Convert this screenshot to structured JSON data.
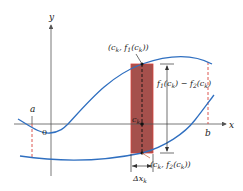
{
  "figure": {
    "type": "area-between-curves",
    "axes": {
      "x_label": "x",
      "y_label": "y",
      "origin_label": "0"
    },
    "bounds": {
      "left_label": "a",
      "right_label": "b"
    },
    "curves": [
      {
        "name": "f1",
        "role": "upper curve y = f1(x)"
      },
      {
        "name": "f2",
        "role": "lower curve y = f2(x)"
      }
    ],
    "strip": {
      "sample_point_label": "c",
      "sample_point_sub": "k",
      "width_label": "Δx",
      "width_sub": "k",
      "top_point_label": "(c_k, f_1(c_k))",
      "bottom_point_label": "(c_k, f_2(c_k))",
      "height_label": "f_1(c_k) − f_2(c_k)"
    },
    "colors": {
      "curve": "#2f6fc0",
      "strip_fill": "#a5504c",
      "strip_border": "#d8433d",
      "bound_dash": "#d8433d",
      "axis": "#555555",
      "text": "#1a1a1a"
    }
  }
}
